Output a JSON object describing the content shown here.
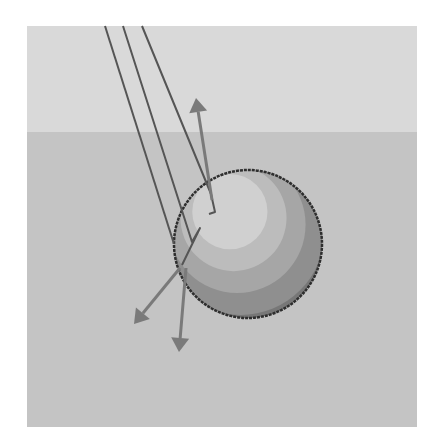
{
  "diagram": {
    "frame": {
      "x": 27,
      "y": 26,
      "w": 390,
      "h": 401
    },
    "colors": {
      "page_bg": "#ffffff",
      "sky": "#d9d9d9",
      "ground": "#c4c4c4",
      "ray": "#555555",
      "arrow": "#7a7a7a",
      "sphere_outline": "#2e2e2e",
      "sphere_bands": [
        "#5f5f5f",
        "#777777",
        "#8f8f8f",
        "#a6a6a6",
        "#bcbcbc",
        "#d0d0d0"
      ]
    },
    "horizon_y": 132,
    "sphere": {
      "cx": 248,
      "cy": 244,
      "r": 74
    },
    "incident_rays": [
      {
        "name": "ray-1",
        "points": [
          [
            105,
            26
          ],
          [
            174,
            244
          ]
        ]
      },
      {
        "name": "ray-2",
        "points": [
          [
            123,
            26
          ],
          [
            192,
            242
          ],
          [
            200,
            228
          ],
          [
            182,
            265
          ]
        ]
      },
      {
        "name": "ray-3",
        "points": [
          [
            142,
            26
          ],
          [
            211,
            194
          ],
          [
            215,
            212
          ],
          [
            209,
            214
          ]
        ]
      }
    ],
    "arrows": [
      {
        "name": "reflected-up-arrow",
        "from": [
          212,
          200
        ],
        "to": [
          196,
          98
        ]
      },
      {
        "name": "reflected-down-left-arrow",
        "from": [
          180,
          268
        ],
        "to": [
          134,
          324
        ]
      },
      {
        "name": "refracted-down-arrow",
        "from": [
          186,
          268
        ],
        "to": [
          179,
          352
        ]
      }
    ]
  }
}
